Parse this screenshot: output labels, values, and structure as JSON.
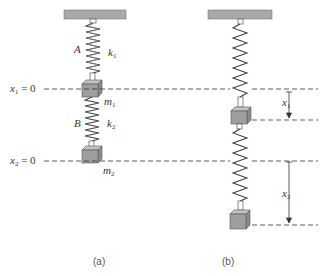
{
  "figure": {
    "panel_a": {
      "caption": "(a)",
      "spring_top_label": "A",
      "spring_top_constant": "k",
      "spring_top_constant_sub": "1",
      "spring_bottom_label": "B",
      "spring_bottom_constant": "k",
      "spring_bottom_constant_sub": "2",
      "mass1": "m",
      "mass1_sub": "1",
      "mass2": "m",
      "mass2_sub": "2",
      "ref1_var": "x",
      "ref1_sub": "1",
      "ref1_eq": " = 0",
      "ref2_var": "x",
      "ref2_sub": "2",
      "ref2_eq": " = 0"
    },
    "panel_b": {
      "caption": "(b)",
      "disp1_var": "x",
      "disp1_sub": "1",
      "disp2_var": "x",
      "disp2_sub": "2"
    },
    "colors": {
      "ceiling": "#a9a9a9",
      "mass": "#9a9a9a",
      "line": "#333333"
    }
  }
}
